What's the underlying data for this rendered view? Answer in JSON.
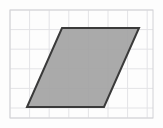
{
  "figure": {
    "title": "Parallelogram on grid",
    "canvas": {
      "width": 163,
      "height": 128,
      "background": "#fdfdfd"
    },
    "colors": {
      "page_background": "#fdfdfd",
      "grid_line": "#e3e3e6",
      "grid_border": "#d2d2d6",
      "shape_fill": "#a3a3a3",
      "shape_stroke": "#3a3a3a"
    },
    "grid": {
      "label": "graph-paper-grid",
      "x": 10,
      "y": 10,
      "width": 143,
      "height": 108,
      "cell_size": 19.6,
      "columns": 7,
      "rows": 6,
      "vertical_lines": [
        10,
        29.6,
        49.2,
        68.8,
        88.4,
        108,
        127.6,
        147.2
      ],
      "horizontal_lines": [
        10,
        29.6,
        49.2,
        68.8,
        88.4,
        108,
        118
      ],
      "grid_on": true,
      "border_on": true
    },
    "shape": {
      "name": "parallelogram",
      "type": "parallelogram",
      "vertex_labels": [
        "top-left",
        "top-right",
        "bottom-right",
        "bottom-left"
      ],
      "vertices": [
        {
          "x": 62,
          "y": 28
        },
        {
          "x": 139,
          "y": 28
        },
        {
          "x": 104,
          "y": 107
        },
        {
          "x": 27,
          "y": 107
        }
      ],
      "points_attr": "62,28 139,28 104,107 27,107",
      "fill": "#a3a3a3",
      "fill_opacity": "0.92",
      "stroke": "#3a3a3a",
      "stroke_width": "2",
      "base_units": 4,
      "height_units": 4,
      "slant_offset_units": 1.8
    }
  }
}
